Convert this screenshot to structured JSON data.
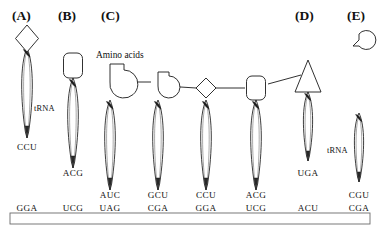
{
  "figure": {
    "mrna_label": "",
    "amino_acids_label": "Amino acids",
    "trna_label": "tRNA"
  },
  "panels": [
    {
      "id": "A",
      "label": "(A)"
    },
    {
      "id": "B",
      "label": "(B)"
    },
    {
      "id": "C",
      "label": "(C)"
    },
    {
      "id": "D",
      "label": "(D)"
    },
    {
      "id": "E",
      "label": "(E)"
    }
  ],
  "trnas": [
    {
      "panel": "A",
      "anticodon": "CCU",
      "amino_acid_shape": "diamond",
      "has_trna_label": true
    },
    {
      "panel": "B",
      "anticodon": "ACG",
      "amino_acid_shape": "rounded-square",
      "has_trna_label": false
    },
    {
      "panel": "C",
      "anticodon": "AUC",
      "amino_acid_shape": "pacman-large",
      "has_trna_label": false
    },
    {
      "panel": "C",
      "anticodon": "GCU",
      "amino_acid_shape": "pacman-small",
      "has_trna_label": false
    },
    {
      "panel": "C",
      "anticodon": "CCU",
      "amino_acid_shape": "diamond",
      "has_trna_label": false
    },
    {
      "panel": "C",
      "anticodon": "ACG",
      "amino_acid_shape": "rounded-square",
      "has_trna_label": false
    },
    {
      "panel": "D",
      "anticodon": "UGA",
      "amino_acid_shape": "triangle",
      "has_trna_label": false
    },
    {
      "panel": "E",
      "anticodon": "CGU",
      "amino_acid_shape": "teardrop",
      "has_trna_label": true
    }
  ],
  "mrna": {
    "codons": [
      "GGA",
      "UCG",
      "UAG",
      "CGA",
      "GGA",
      "UCG",
      "ACU",
      "CGA"
    ]
  },
  "colors": {
    "stroke": "#1a1a1a",
    "fill": "#ffffff",
    "text": "#111111"
  }
}
